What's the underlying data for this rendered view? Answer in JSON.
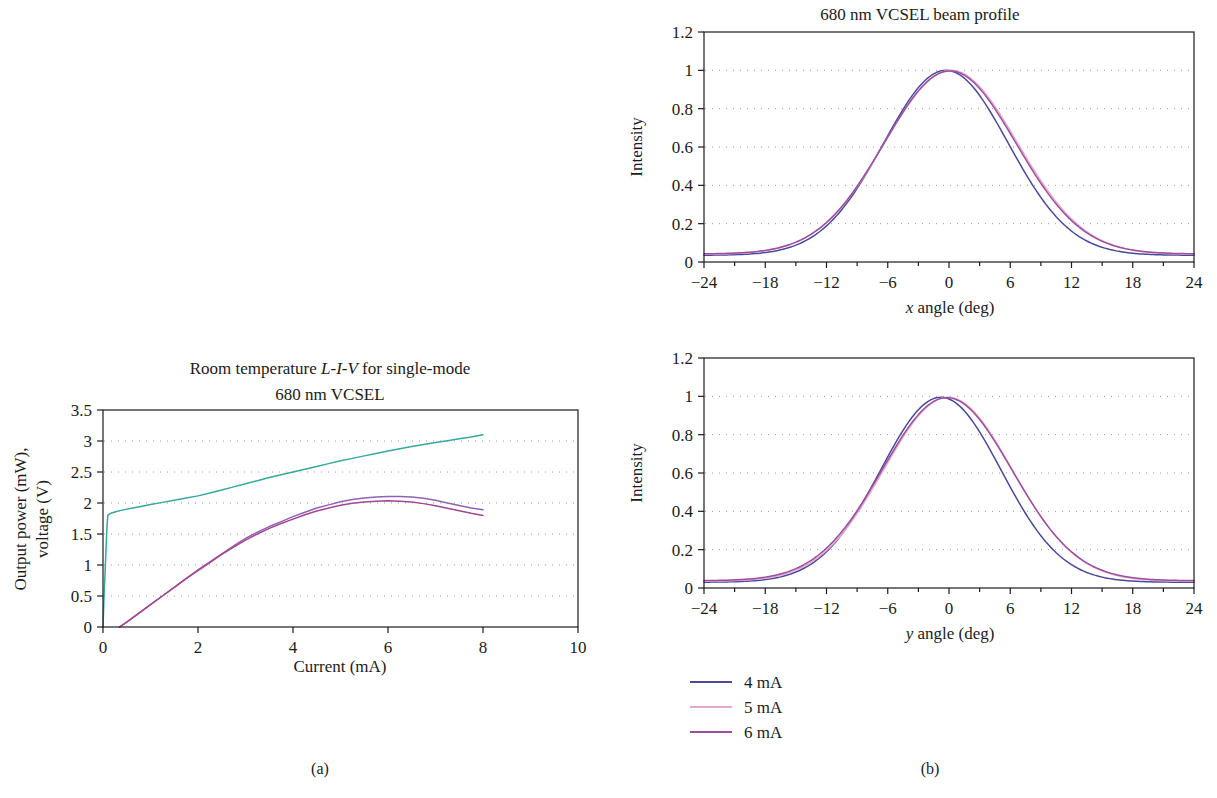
{
  "figure": {
    "caption_a": "(a)",
    "caption_b": "(b)"
  },
  "chart_data": [
    {
      "id": "liv",
      "type": "line",
      "title_line1_pre": "Room temperature ",
      "title_line1_ital": "L-I-V",
      "title_line1_post": " for single-mode",
      "title_line2": "680 nm VCSEL",
      "title": "Room temperature L-I-V for single-mode 680 nm VCSEL",
      "xlabel": "Current (mA)",
      "ylabel_line1": "Output power (mW),",
      "ylabel_line2": "voltage (V)",
      "ylabel": "Output power (mW), voltage (V)",
      "xlim": [
        0,
        10
      ],
      "ylim": [
        0,
        3.5
      ],
      "xticks": [
        0,
        2,
        4,
        6,
        8,
        10
      ],
      "xtick_labels": [
        "0",
        "2",
        "4",
        "6",
        "8",
        "10"
      ],
      "yticks": [
        0,
        0.5,
        1,
        1.5,
        2,
        2.5,
        3,
        3.5
      ],
      "ytick_labels": [
        "0",
        "0.5",
        "1",
        "1.5",
        "2",
        "2.5",
        "3",
        "3.5"
      ],
      "grid": "horizontal-dotted",
      "legend": "none",
      "series": [
        {
          "name": "voltage",
          "color": "#35a8a0",
          "x": [
            0.0,
            0.02,
            0.05,
            0.08,
            0.1,
            0.15,
            0.25,
            0.4,
            0.6,
            0.8,
            1.0,
            1.25,
            1.5,
            1.75,
            2.0,
            2.25,
            2.5,
            2.75,
            3.0,
            3.25,
            3.5,
            3.75,
            4.0,
            4.25,
            4.5,
            4.75,
            5.0,
            5.25,
            5.5,
            5.75,
            6.0,
            6.25,
            6.5,
            6.75,
            7.0,
            7.25,
            7.5,
            7.75,
            8.0
          ],
          "y": [
            0.0,
            0.45,
            1.0,
            1.55,
            1.8,
            1.83,
            1.855,
            1.885,
            1.915,
            1.945,
            1.975,
            2.01,
            2.045,
            2.08,
            2.115,
            2.16,
            2.21,
            2.26,
            2.31,
            2.36,
            2.41,
            2.455,
            2.5,
            2.545,
            2.59,
            2.635,
            2.68,
            2.72,
            2.76,
            2.8,
            2.84,
            2.875,
            2.91,
            2.945,
            2.975,
            3.005,
            3.035,
            3.065,
            3.1
          ]
        },
        {
          "name": "power-upper",
          "color": "#8d63b5",
          "x": [
            0.35,
            0.5,
            0.75,
            1.0,
            1.25,
            1.5,
            1.75,
            2.0,
            2.25,
            2.5,
            2.75,
            3.0,
            3.25,
            3.5,
            3.75,
            4.0,
            4.25,
            4.5,
            4.75,
            5.0,
            5.25,
            5.5,
            5.75,
            6.0,
            6.25,
            6.5,
            6.75,
            7.0,
            7.25,
            7.5,
            7.75,
            8.0
          ],
          "y": [
            0.0,
            0.08,
            0.22,
            0.36,
            0.5,
            0.64,
            0.78,
            0.92,
            1.05,
            1.18,
            1.31,
            1.43,
            1.53,
            1.62,
            1.7,
            1.78,
            1.85,
            1.92,
            1.97,
            2.02,
            2.055,
            2.08,
            2.095,
            2.105,
            2.105,
            2.095,
            2.075,
            2.045,
            2.0,
            1.96,
            1.92,
            1.89
          ]
        },
        {
          "name": "power-lower",
          "color": "#a5478f",
          "x": [
            0.35,
            0.5,
            0.75,
            1.0,
            1.25,
            1.5,
            1.75,
            2.0,
            2.25,
            2.5,
            2.75,
            3.0,
            3.25,
            3.5,
            3.75,
            4.0,
            4.25,
            4.5,
            4.75,
            5.0,
            5.25,
            5.5,
            5.75,
            6.0,
            6.25,
            6.5,
            6.75,
            7.0,
            7.25,
            7.5,
            7.75,
            8.0
          ],
          "y": [
            0.0,
            0.08,
            0.22,
            0.36,
            0.5,
            0.64,
            0.78,
            0.91,
            1.04,
            1.17,
            1.29,
            1.4,
            1.5,
            1.59,
            1.67,
            1.74,
            1.81,
            1.87,
            1.92,
            1.965,
            1.995,
            2.015,
            2.03,
            2.035,
            2.03,
            2.015,
            1.99,
            1.955,
            1.915,
            1.875,
            1.835,
            1.8
          ]
        }
      ]
    },
    {
      "id": "beam-x",
      "type": "line",
      "title": "680 nm VCSEL beam profile",
      "xlabel_ital": "x",
      "xlabel_rest": " angle (deg)",
      "xlabel": "x angle (deg)",
      "ylabel": "Intensity",
      "xlim": [
        -24,
        24
      ],
      "ylim": [
        0,
        1.2
      ],
      "xticks": [
        -24,
        -18,
        -12,
        -6,
        0,
        6,
        12,
        18,
        24
      ],
      "xtick_labels": [
        "−24",
        "−18",
        "−12",
        "−6",
        "0",
        "6",
        "12",
        "18",
        "24"
      ],
      "yticks": [
        0,
        0.2,
        0.4,
        0.6,
        0.8,
        1,
        1.2
      ],
      "ytick_labels": [
        "0",
        "0.2",
        "0.4",
        "0.6",
        "0.8",
        "1",
        "1.2"
      ],
      "grid": "horizontal-dotted",
      "series": [
        {
          "name": "4 mA",
          "color": "#4a4a9c",
          "gauss": {
            "amp": 0.965,
            "center": -0.3,
            "sigma": 6.1,
            "baseline": 0.035
          }
        },
        {
          "name": "5 mA",
          "color": "#e7a8d0",
          "gauss": {
            "amp": 0.96,
            "center": 0.2,
            "sigma": 6.5,
            "baseline": 0.04
          }
        },
        {
          "name": "6 mA",
          "color": "#9c4f9c",
          "gauss": {
            "amp": 0.955,
            "center": 0.1,
            "sigma": 6.45,
            "baseline": 0.042
          }
        }
      ]
    },
    {
      "id": "beam-y",
      "type": "line",
      "title": "",
      "xlabel_ital": "y",
      "xlabel_rest": " angle (deg)",
      "xlabel": "y angle (deg)",
      "ylabel": "Intensity",
      "xlim": [
        -24,
        24
      ],
      "ylim": [
        0,
        1.2
      ],
      "xticks": [
        -24,
        -18,
        -12,
        -6,
        0,
        6,
        12,
        18,
        24
      ],
      "xtick_labels": [
        "−24",
        "−18",
        "−12",
        "−6",
        "0",
        "6",
        "12",
        "18",
        "24"
      ],
      "yticks": [
        0,
        0.2,
        0.4,
        0.6,
        0.8,
        1,
        1.2
      ],
      "ytick_labels": [
        "0",
        "0.2",
        "0.4",
        "0.6",
        "0.8",
        "1",
        "1.2"
      ],
      "grid": "horizontal-dotted",
      "series": [
        {
          "name": "4 mA",
          "color": "#4a4a9c",
          "gauss": {
            "amp": 0.965,
            "center": -0.8,
            "sigma": 5.9,
            "baseline": 0.03
          }
        },
        {
          "name": "5 mA",
          "color": "#e7a8d0",
          "gauss": {
            "amp": 0.96,
            "center": -0.1,
            "sigma": 6.3,
            "baseline": 0.035
          }
        },
        {
          "name": "6 mA",
          "color": "#9c4f9c",
          "gauss": {
            "amp": 0.955,
            "center": -0.2,
            "sigma": 6.35,
            "baseline": 0.038
          }
        }
      ]
    }
  ],
  "legend": {
    "items": [
      {
        "label": "4 mA",
        "color": "#4a4a9c"
      },
      {
        "label": "5 mA",
        "color": "#e7a8d0"
      },
      {
        "label": "6 mA",
        "color": "#9c4f9c"
      }
    ]
  }
}
